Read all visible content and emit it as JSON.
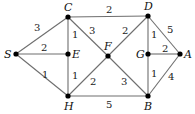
{
  "graph": {
    "type": "weighted-undirected",
    "nodes": [
      {
        "id": "S",
        "label": "S",
        "x": 16,
        "y": 54,
        "lx": 4,
        "ly": 58
      },
      {
        "id": "C",
        "label": "C",
        "x": 68,
        "y": 17,
        "lx": 64,
        "ly": 11
      },
      {
        "id": "E",
        "label": "E",
        "x": 68,
        "y": 54,
        "lx": 72,
        "ly": 58
      },
      {
        "id": "H",
        "label": "H",
        "x": 68,
        "y": 96,
        "lx": 64,
        "ly": 110
      },
      {
        "id": "F",
        "label": "F",
        "x": 108,
        "y": 56,
        "lx": 104,
        "ly": 50
      },
      {
        "id": "D",
        "label": "D",
        "x": 148,
        "y": 16,
        "lx": 144,
        "ly": 10
      },
      {
        "id": "G",
        "label": "G",
        "x": 148,
        "y": 54,
        "lx": 136,
        "ly": 58
      },
      {
        "id": "A",
        "label": "A",
        "x": 180,
        "y": 54,
        "lx": 184,
        "ly": 58
      },
      {
        "id": "B",
        "label": "B",
        "x": 148,
        "y": 96,
        "lx": 144,
        "ly": 110
      }
    ],
    "edges": [
      {
        "from": "S",
        "to": "C",
        "weight": "3",
        "wx": 34,
        "wy": 31
      },
      {
        "from": "S",
        "to": "E",
        "weight": "2",
        "wx": 41,
        "wy": 51
      },
      {
        "from": "S",
        "to": "H",
        "weight": "1",
        "wx": 42,
        "wy": 78
      },
      {
        "from": "C",
        "to": "E",
        "weight": "1",
        "wx": 72,
        "wy": 38
      },
      {
        "from": "E",
        "to": "H",
        "weight": "1",
        "wx": 72,
        "wy": 79
      },
      {
        "from": "C",
        "to": "D",
        "weight": "2",
        "wx": 106,
        "wy": 13
      },
      {
        "from": "C",
        "to": "F",
        "weight": "3",
        "wx": 89,
        "wy": 34
      },
      {
        "from": "D",
        "to": "F",
        "weight": "2",
        "wx": 122,
        "wy": 34
      },
      {
        "from": "F",
        "to": "H",
        "weight": "2",
        "wx": 90,
        "wy": 85
      },
      {
        "from": "F",
        "to": "B",
        "weight": "3",
        "wx": 121,
        "wy": 85
      },
      {
        "from": "H",
        "to": "B",
        "weight": "5",
        "wx": 106,
        "wy": 108
      },
      {
        "from": "D",
        "to": "G",
        "weight": "1",
        "wx": 151,
        "wy": 38
      },
      {
        "from": "D",
        "to": "A",
        "weight": "5",
        "wx": 167,
        "wy": 33
      },
      {
        "from": "G",
        "to": "A",
        "weight": "2",
        "wx": 162,
        "wy": 52
      },
      {
        "from": "G",
        "to": "B",
        "weight": "1",
        "wx": 151,
        "wy": 77
      },
      {
        "from": "A",
        "to": "B",
        "weight": "4",
        "wx": 168,
        "wy": 80
      }
    ]
  }
}
